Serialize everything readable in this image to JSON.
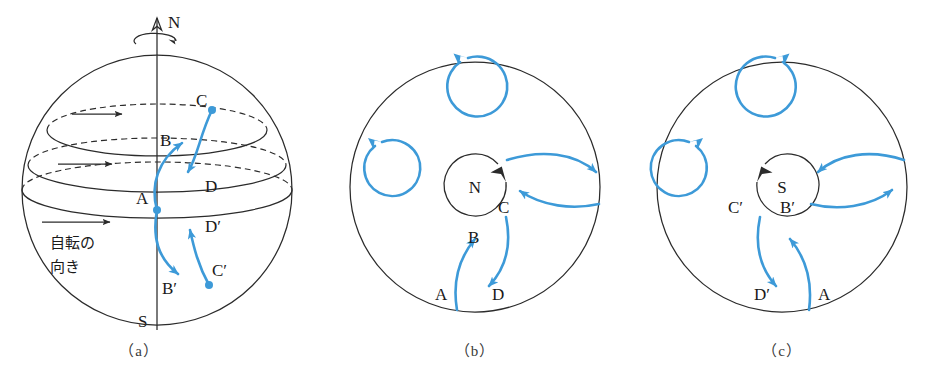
{
  "figure": {
    "accent_color": "#3d9ad8",
    "line_color": "#2b2b2b",
    "background": "#ffffff"
  },
  "panels": [
    {
      "id": "a",
      "caption": "（a）",
      "type": "sphere-side-view",
      "pole_labels": {
        "north": "N",
        "south": "S"
      },
      "rotation_note": {
        "line1": "自転の",
        "line2": "向き",
        "meaning": "direction of rotation"
      },
      "point_labels": [
        "C",
        "B",
        "A",
        "D",
        "D′",
        "C′",
        "B′"
      ],
      "latitude_circles": 3,
      "rotation_arrows": 3,
      "trajectories": [
        {
          "name": "A-to-B",
          "from": "A",
          "to": "B",
          "direction": "northward-deflect-right"
        },
        {
          "name": "C-to-D",
          "from": "C",
          "to": "D",
          "direction": "southward-deflect-right"
        },
        {
          "name": "A-to-B-prime",
          "from": "A",
          "to": "B′",
          "direction": "southward-deflect-left"
        },
        {
          "name": "C-prime-to-D-prime",
          "from": "C′",
          "to": "D′",
          "direction": "northward-deflect-left"
        }
      ]
    },
    {
      "id": "b",
      "caption": "（b）",
      "type": "north-pole-top-view",
      "center_label": "N",
      "center_spin": "counterclockwise",
      "eddy_spin": "counterclockwise",
      "eddies": 2,
      "point_labels": [
        "A",
        "B",
        "C",
        "D"
      ],
      "trajectories": [
        {
          "name": "A-to-B",
          "from": "A",
          "to": "B",
          "direction": "inward-deflect-right"
        },
        {
          "name": "C-to-D",
          "from": "C",
          "to": "D",
          "direction": "outward-deflect-right"
        }
      ],
      "side_flow": [
        {
          "name": "upper-flow",
          "direction": "rightward"
        },
        {
          "name": "lower-flow",
          "direction": "leftward"
        }
      ]
    },
    {
      "id": "c",
      "caption": "（c）",
      "type": "south-pole-bottom-view",
      "center_label": "S",
      "center_spin": "clockwise",
      "eddy_spin": "clockwise",
      "eddies": 2,
      "point_labels": [
        "A",
        "B′",
        "C′",
        "D′"
      ],
      "trajectories": [
        {
          "name": "A-to-B-prime",
          "from": "A",
          "to": "B′",
          "direction": "inward-deflect-left"
        },
        {
          "name": "C-prime-to-D-prime",
          "from": "C′",
          "to": "D′",
          "direction": "outward-deflect-left"
        }
      ],
      "side_flow": [
        {
          "name": "upper-flow",
          "direction": "leftward"
        },
        {
          "name": "lower-flow",
          "direction": "rightward"
        }
      ]
    }
  ]
}
